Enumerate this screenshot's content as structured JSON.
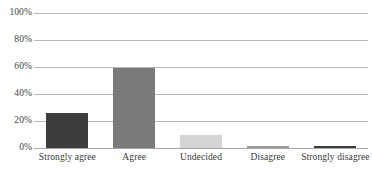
{
  "chart_data": {
    "type": "bar",
    "title": "",
    "subtitle": "",
    "xlabel": "",
    "ylabel": "",
    "categories": [
      "Strongly agree",
      "Agree",
      "Undecided",
      "Disagree",
      "Strongly disagree"
    ],
    "values": [
      26,
      59,
      10,
      1.5,
      1.5
    ],
    "ylim": [
      0,
      100
    ],
    "ytick_labels": [
      "0%",
      "20%",
      "40%",
      "60%",
      "80%",
      "100%"
    ],
    "ytick_values": [
      0,
      20,
      40,
      60,
      80,
      100
    ],
    "grid": "horizontal",
    "legend": "none",
    "bar_colors": [
      "#3d3d3d",
      "#7a7a7a",
      "#d4d4d4",
      "#fdfdfd",
      "#3d3d3d"
    ],
    "bar_border_colors": [
      "#3d3d3d",
      "#7a7a7a",
      "#d4d4d4",
      "#9a9a9a",
      "#3d3d3d"
    ],
    "gridline_color": "#b9b9b9",
    "axis_color": "#a8a8a8",
    "text_color": "#3a3a3a"
  }
}
